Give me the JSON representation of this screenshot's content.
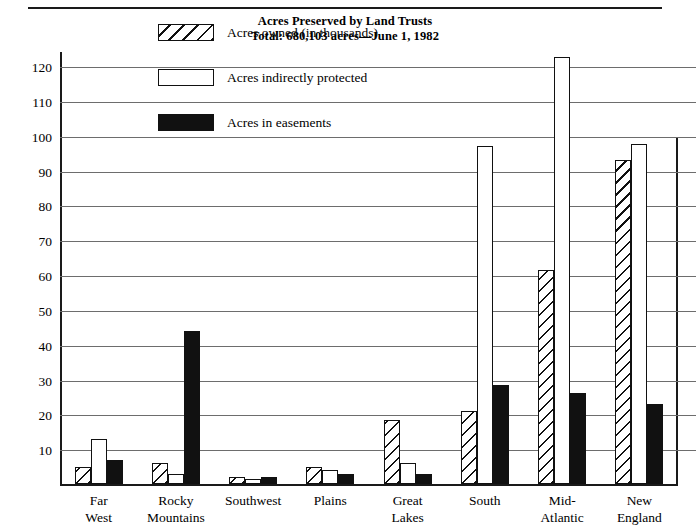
{
  "chart_data": {
    "type": "bar",
    "title": "Acres Preserved by Land Trusts",
    "subtitle": "Total: 680,103 acres—June 1, 1982",
    "xlabel": "",
    "ylabel": "",
    "ylim": [
      0,
      124.6
    ],
    "grid": true,
    "legend_position": "inside-top-left",
    "yticks": [
      10,
      20,
      30,
      40,
      50,
      60,
      70,
      80,
      90,
      100,
      110,
      120
    ],
    "ytick_labels": [
      "10",
      "20",
      "30",
      "40",
      "50",
      "60",
      "70",
      "80",
      "90",
      "100",
      "110",
      "120"
    ],
    "categories": [
      "Far West",
      "Rocky Mountains",
      "Southwest",
      "Plains",
      "Great Lakes",
      "South",
      "Mid-Atlantic",
      "New England"
    ],
    "category_lines": [
      [
        "Far",
        "West"
      ],
      [
        "Rocky",
        "Mountains"
      ],
      [
        "Southwest"
      ],
      [
        "Plains"
      ],
      [
        "Great",
        "Lakes"
      ],
      [
        "South"
      ],
      [
        "Mid-",
        "Atlantic"
      ],
      [
        "New",
        "England"
      ]
    ],
    "series": [
      {
        "name": "Acres owned (in thousands)",
        "pattern": "diagonal-hatch",
        "color": "#ffffff",
        "values": [
          5,
          6,
          2,
          5,
          18.5,
          21,
          61.5,
          93
        ]
      },
      {
        "name": "Acres indirectly protected",
        "pattern": "outline",
        "color": "#ffffff",
        "values": [
          13,
          3,
          1.5,
          4,
          6,
          97,
          122.5,
          97.5
        ]
      },
      {
        "name": "Acres in easements",
        "pattern": "solid",
        "color": "#111111",
        "values": [
          7,
          44,
          2,
          3,
          3,
          28.5,
          26,
          23
        ]
      }
    ]
  },
  "legend": {
    "items": [
      {
        "label": "Acres owned (in thousands)",
        "swatch": "hatch"
      },
      {
        "label": "Acres indirectly protected",
        "swatch": "outline"
      },
      {
        "label": "Acres in easements",
        "swatch": "solid"
      }
    ]
  }
}
